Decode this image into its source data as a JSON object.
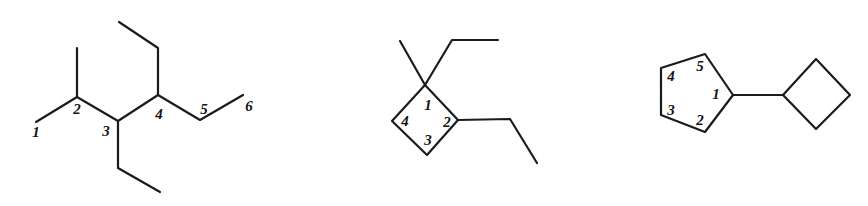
{
  "figure": {
    "background_color": "#ffffff",
    "line_color": "#1b1b1b",
    "label_color": "#121212",
    "width": 868,
    "height": 206,
    "structure_count": 3
  },
  "structures": [
    {
      "id": "structure-1",
      "kind": "acyclic-skeletal-chain",
      "name": "numbered six-carbon main chain with methyl and ethyl branches",
      "locants": [
        {
          "text": "1",
          "x": 36,
          "y": 134
        },
        {
          "text": "2",
          "x": 77,
          "y": 111
        },
        {
          "text": "3",
          "x": 106,
          "y": 133
        },
        {
          "text": "4",
          "x": 159,
          "y": 116
        },
        {
          "text": "5",
          "x": 204,
          "y": 111
        },
        {
          "text": "6",
          "x": 249,
          "y": 108
        }
      ],
      "main_chain": "36,122 77,97 118,121 158,95 200,120 243,95",
      "branches": [
        {
          "name": "methyl-on-c2",
          "path": "77,97 77,48"
        },
        {
          "name": "ethyl-on-c3",
          "path": "118,121 118,168 160,192"
        },
        {
          "name": "ethyl-on-c4",
          "path": "158,95 158,48 119,22"
        }
      ]
    },
    {
      "id": "structure-2",
      "kind": "cyclobutane-skeletal",
      "name": "numbered cyclobutane ring with methyl and ethyl at C1 and ethyl at C2",
      "ring_points": "425,85 458,120 427,155 392,121",
      "locants": [
        {
          "text": "1",
          "x": 428,
          "y": 107
        },
        {
          "text": "2",
          "x": 447,
          "y": 124
        },
        {
          "text": "3",
          "x": 428,
          "y": 142
        },
        {
          "text": "4",
          "x": 405,
          "y": 123
        }
      ],
      "branches": [
        {
          "name": "methyl-on-c1",
          "path": "425,85 400,41"
        },
        {
          "name": "ethyl-on-c1",
          "path": "425,85 452,40 498,40"
        },
        {
          "name": "ethyl-on-c2",
          "path": "458,120 510,119 537,163"
        }
      ]
    },
    {
      "id": "structure-3",
      "kind": "cyclopentane-cyclobutane-skeletal",
      "name": "numbered cyclopentane ring bonded to a cyclobutane ring",
      "cyclopentane_points": "733,95 705,54 661,68 661,115 705,132",
      "cyclobutane_points": "783,95 816,59 850,95 816,129",
      "connecting_bond": "733,95 783,95",
      "locants": [
        {
          "text": "1",
          "x": 716,
          "y": 96
        },
        {
          "text": "2",
          "x": 700,
          "y": 122
        },
        {
          "text": "3",
          "x": 671,
          "y": 112
        },
        {
          "text": "4",
          "x": 671,
          "y": 78
        },
        {
          "text": "5",
          "x": 700,
          "y": 68
        }
      ]
    }
  ]
}
